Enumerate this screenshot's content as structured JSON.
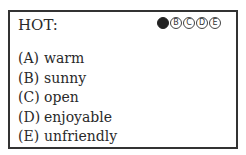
{
  "question": {
    "word": "HOT:",
    "bubbles": [
      {
        "letter": "A",
        "filled": true
      },
      {
        "letter": "B",
        "filled": false
      },
      {
        "letter": "C",
        "filled": false
      },
      {
        "letter": "D",
        "filled": false
      },
      {
        "letter": "E",
        "filled": false
      }
    ],
    "options": [
      {
        "letter": "(A)",
        "text": "warm"
      },
      {
        "letter": "(B)",
        "text": "sunny"
      },
      {
        "letter": "(C)",
        "text": "open"
      },
      {
        "letter": "(D)",
        "text": "enjoyable"
      },
      {
        "letter": "(E)",
        "text": "unfriendly"
      }
    ]
  }
}
